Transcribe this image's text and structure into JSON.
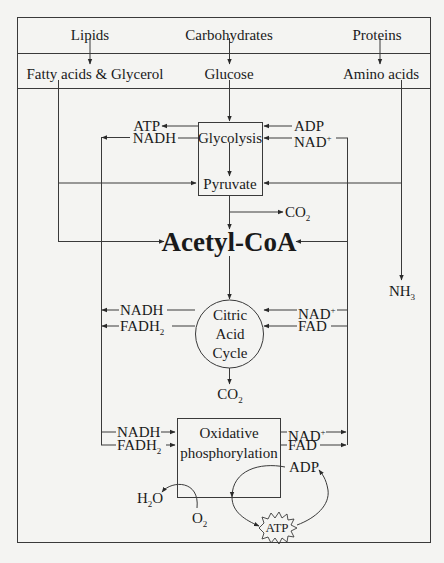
{
  "diagram": {
    "sources": {
      "lipids": "Lipids",
      "carbohydrates": "Carbohydrates",
      "proteins": "Proteins"
    },
    "monomers": {
      "fatty_acids": "Fatty acids & Glycerol",
      "glucose": "Glucose",
      "amino_acids": "Amino acids"
    },
    "glycolysis": {
      "label": "Glycolysis",
      "product": "Pyruvate",
      "out_atp": "ATP",
      "out_nadh": "NADH",
      "in_adp": "ADP",
      "in_nad": "NAD",
      "in_nad_sup": "+"
    },
    "co2_pyruvate": "CO",
    "co2_sub": "2",
    "acetyl_coa": "Acetyl-CoA",
    "nh3": "NH",
    "nh3_sub": "3",
    "citric_acid_cycle": {
      "line1": "Citric",
      "line2": "Acid",
      "line3": "Cycle",
      "out_nadh": "NADH",
      "out_fadh": "FADH",
      "out_fadh_sub": "2",
      "in_nad": "NAD",
      "in_nad_sup": "+",
      "in_fad": "FAD",
      "co2": "CO",
      "co2_sub": "2"
    },
    "oxidative_phosphorylation": {
      "line1": "Oxidative",
      "line2": "phosphorylation",
      "in_nadh": "NADH",
      "in_fadh": "FADH",
      "in_fadh_sub": "2",
      "out_nad": "NAD",
      "out_nad_sup": "+",
      "out_fad": "FAD",
      "adp": "ADP",
      "atp": "ATP",
      "h2o_h": "H",
      "h2o_sub": "2",
      "h2o_o": "O",
      "o2": "O",
      "o2_sub": "2"
    },
    "colors": {
      "line": "#3a3a3a",
      "background": "#f4f4f2",
      "text": "#1a1a1a"
    }
  }
}
